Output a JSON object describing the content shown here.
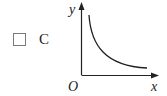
{
  "option": {
    "label": "C",
    "checked": false
  },
  "graph": {
    "y_label": "y",
    "x_label": "x",
    "origin_label": "O",
    "curve": "decreasing hyperbola-like curve (y = k/x, x>0)",
    "stroke_color": "#222222"
  }
}
